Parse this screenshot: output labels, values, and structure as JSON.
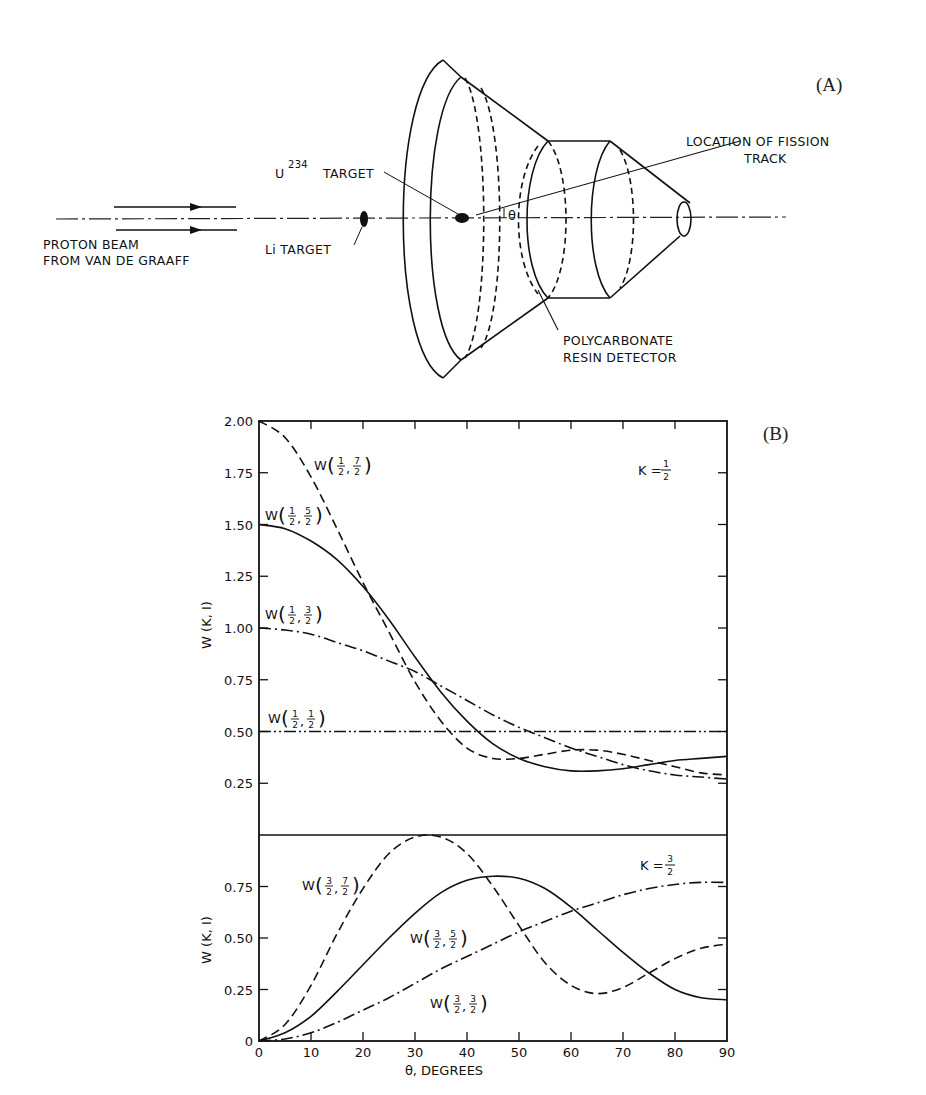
{
  "panel_a": {
    "label": "(A)",
    "proton_beam_line1": "PROTON BEAM",
    "proton_beam_line2": "FROM VAN DE GRAAFF",
    "li_target": "Li TARGET",
    "u_target_prefix": "U",
    "u_target_sup": "234",
    "u_target_suffix": "TARGET",
    "fission_line1": "LOCATION OF FISSION",
    "fission_line2": "TRACK",
    "detector_line1": "POLYCARBONATE",
    "detector_line2": "RESIN DETECTOR",
    "angle_symbol": "θ"
  },
  "panel_b": {
    "label": "(B)",
    "upper_k": "K = 1/2",
    "lower_k": "K = 3/2",
    "ylabel": "W (K, I)",
    "xlabel": "θ, DEGREES",
    "upper_yticks": [
      "2.00",
      "1.75",
      "1.50",
      "1.25",
      "1.00",
      "0.75",
      "0.50",
      "0.25"
    ],
    "lower_yticks": [
      "0.75",
      "0.50",
      "0.25",
      "0"
    ],
    "xticks": [
      "0",
      "10",
      "20",
      "30",
      "40",
      "50",
      "60",
      "70",
      "80",
      "90"
    ],
    "curve_labels": {
      "u72": "W(1/2, 7/2)",
      "u52": "W(1/2, 5/2)",
      "u32": "W(1/2, 3/2)",
      "u12": "W(1/2, 1/2)",
      "l72": "W(3/2, 7/2)",
      "l52": "W(3/2, 5/2)",
      "l32": "W(3/2, 3/2)"
    }
  },
  "chart_data": [
    {
      "type": "line",
      "title": "K = 1/2",
      "xlabel": "θ, DEGREES",
      "ylabel": "W (K, I)",
      "xlim": [
        0,
        90
      ],
      "ylim": [
        0,
        2.0
      ],
      "grid": false,
      "x": [
        0,
        5,
        10,
        15,
        20,
        25,
        30,
        35,
        40,
        45,
        50,
        55,
        60,
        65,
        70,
        75,
        80,
        85,
        90
      ],
      "series": [
        {
          "name": "W(1/2, 7/2)",
          "style": "dashed",
          "values": [
            2.0,
            1.92,
            1.73,
            1.48,
            1.22,
            0.98,
            0.74,
            0.55,
            0.42,
            0.37,
            0.37,
            0.39,
            0.41,
            0.41,
            0.39,
            0.36,
            0.33,
            0.3,
            0.29
          ]
        },
        {
          "name": "W(1/2, 5/2)",
          "style": "solid",
          "values": [
            1.5,
            1.48,
            1.42,
            1.33,
            1.2,
            1.04,
            0.86,
            0.69,
            0.55,
            0.44,
            0.37,
            0.33,
            0.31,
            0.31,
            0.32,
            0.34,
            0.36,
            0.37,
            0.38
          ]
        },
        {
          "name": "W(1/2, 3/2)",
          "style": "dash-dot",
          "values": [
            1.0,
            0.99,
            0.97,
            0.93,
            0.89,
            0.84,
            0.79,
            0.72,
            0.65,
            0.58,
            0.52,
            0.47,
            0.42,
            0.38,
            0.34,
            0.31,
            0.29,
            0.28,
            0.27
          ]
        },
        {
          "name": "W(1/2, 1/2)",
          "style": "dash-dot-dot",
          "values": [
            0.5,
            0.5,
            0.5,
            0.5,
            0.5,
            0.5,
            0.5,
            0.5,
            0.5,
            0.5,
            0.5,
            0.5,
            0.5,
            0.5,
            0.5,
            0.5,
            0.5,
            0.5,
            0.5
          ]
        }
      ]
    },
    {
      "type": "line",
      "title": "K = 3/2",
      "xlabel": "θ, DEGREES",
      "ylabel": "W (K, I)",
      "xlim": [
        0,
        90
      ],
      "ylim": [
        0,
        1.0
      ],
      "grid": false,
      "x": [
        0,
        5,
        10,
        15,
        20,
        25,
        30,
        35,
        40,
        45,
        50,
        55,
        60,
        65,
        70,
        75,
        80,
        85,
        90
      ],
      "series": [
        {
          "name": "W(3/2, 7/2)",
          "style": "dashed",
          "values": [
            0.0,
            0.08,
            0.27,
            0.52,
            0.74,
            0.91,
            0.99,
            0.99,
            0.91,
            0.75,
            0.56,
            0.38,
            0.27,
            0.23,
            0.26,
            0.33,
            0.4,
            0.45,
            0.47
          ]
        },
        {
          "name": "W(3/2, 5/2)",
          "style": "solid",
          "values": [
            0.0,
            0.04,
            0.12,
            0.24,
            0.37,
            0.5,
            0.62,
            0.72,
            0.78,
            0.8,
            0.79,
            0.74,
            0.65,
            0.54,
            0.43,
            0.33,
            0.25,
            0.21,
            0.2
          ]
        },
        {
          "name": "W(3/2, 3/2)",
          "style": "dash-dot",
          "values": [
            0.0,
            0.01,
            0.04,
            0.09,
            0.15,
            0.21,
            0.28,
            0.35,
            0.41,
            0.47,
            0.53,
            0.58,
            0.63,
            0.67,
            0.71,
            0.74,
            0.76,
            0.77,
            0.77
          ]
        }
      ]
    }
  ]
}
